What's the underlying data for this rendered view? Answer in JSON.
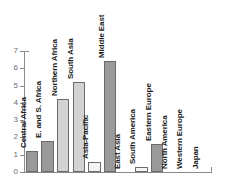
{
  "chart_data": {
    "type": "bar",
    "title": "",
    "subtitle": "",
    "xlabel": "",
    "ylabel": "",
    "ylim": [
      0,
      7
    ],
    "grid": false,
    "legend": null,
    "y_ticks": [
      "0",
      "1",
      "2",
      "3",
      "4",
      "5",
      "6",
      "7"
    ],
    "categories": [
      "Central Africa",
      "E. and S. Africa",
      "Northern Africa",
      "South Asia",
      "Asia-Pacific",
      "Middle East",
      "East Asia",
      "South America",
      "Eastern Europe",
      "North America",
      "Western Europe",
      "Japan"
    ],
    "values": [
      1.2,
      1.8,
      4.2,
      5.2,
      0.6,
      6.4,
      0,
      0.3,
      1.6,
      0,
      0,
      0
    ],
    "bar_tones": [
      "dark",
      "dark",
      "light",
      "light",
      "white",
      "dark",
      "none",
      "white",
      "dark",
      "none",
      "none",
      "none"
    ],
    "colors": {
      "dark": "#9a9a9a",
      "light": "#d2d2d2",
      "white": "#f4f4f4",
      "outline": "#6b6b6b",
      "axis": "#8a8a8a",
      "tick_text": "#6e6e6e",
      "label_text": "#1a1a1a",
      "background": "#ffffff"
    }
  }
}
